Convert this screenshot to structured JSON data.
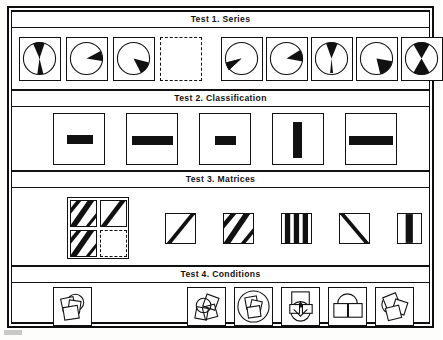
{
  "document": {
    "kind": "psychometric-test-figure",
    "background_color": "#ffffff",
    "ink_color": "#111111"
  },
  "sections": [
    {
      "id": "test-1",
      "title": "Test 1.  Series",
      "kind": "series",
      "stem_label": "series-stem",
      "stem_count": 3,
      "blank_label": "missing-item",
      "option_count": 5,
      "stem": [
        {
          "name": "pie-narrow-wedge-down",
          "start_deg": 172,
          "sweep_deg": 22,
          "second_start_deg": null,
          "second_sweep_deg": null
        },
        {
          "name": "pie-wedge-upper-right",
          "start_deg": 22,
          "sweep_deg": 52,
          "second_start_deg": null,
          "second_sweep_deg": null
        },
        {
          "name": "pie-wedge-lower-right",
          "start_deg": 92,
          "sweep_deg": 52,
          "second_start_deg": null,
          "second_sweep_deg": null
        }
      ],
      "options": [
        {
          "name": "pie-wedge-lower-left",
          "start_deg": 185,
          "sweep_deg": 52,
          "second_start_deg": null,
          "second_sweep_deg": null
        },
        {
          "name": "pie-wedge-right",
          "start_deg": 65,
          "sweep_deg": 48,
          "second_start_deg": null,
          "second_sweep_deg": null
        },
        {
          "name": "pie-wide-wedge-down",
          "start_deg": 162,
          "sweep_deg": 40,
          "second_start_deg": null,
          "second_sweep_deg": null
        },
        {
          "name": "pie-wedge-lower-right-wide",
          "start_deg": 100,
          "sweep_deg": 62,
          "second_start_deg": null,
          "second_sweep_deg": null
        },
        {
          "name": "pie-hourglass-two-wedges",
          "start_deg": 150,
          "sweep_deg": 60,
          "second_start_deg": 330,
          "second_sweep_deg": 60
        }
      ]
    },
    {
      "id": "test-2",
      "title": "Test 2.  Classification",
      "kind": "classification",
      "option_count": 5,
      "options": [
        {
          "name": "box-bar-horizontal-small",
          "box_w": 52,
          "box_h": 52,
          "bar_w": 26,
          "bar_h": 9,
          "orient": "horizontal"
        },
        {
          "name": "box-bar-horizontal-wide",
          "box_w": 52,
          "box_h": 52,
          "bar_w": 41,
          "bar_h": 9,
          "orient": "horizontal"
        },
        {
          "name": "box-bar-horizontal-tiny",
          "box_w": 52,
          "box_h": 52,
          "bar_w": 21,
          "bar_h": 9,
          "orient": "horizontal"
        },
        {
          "name": "box-bar-vertical-tall",
          "box_w": 52,
          "box_h": 52,
          "bar_w": 9,
          "bar_h": 36,
          "orient": "vertical"
        },
        {
          "name": "box-bar-horizontal-long",
          "box_w": 52,
          "box_h": 52,
          "bar_w": 44,
          "bar_h": 9,
          "orient": "horizontal"
        }
      ]
    },
    {
      "id": "test-3",
      "title": "Test 3.  Matrices",
      "kind": "matrices",
      "matrix_label": "matrix-2x2",
      "matrix_cells": [
        {
          "name": "matrix-cell-two-diagonals-up",
          "stripes": 2,
          "orient": "diagonal-up"
        },
        {
          "name": "matrix-cell-one-diagonal-up",
          "stripes": 1,
          "orient": "diagonal-up"
        },
        {
          "name": "matrix-cell-two-diagonals-up",
          "stripes": 2,
          "orient": "diagonal-up"
        },
        {
          "name": "matrix-cell-blank",
          "stripes": 0,
          "orient": "blank"
        }
      ],
      "option_count": 5,
      "options": [
        {
          "name": "option-one-diagonal-up",
          "stripes": 1,
          "orient": "diagonal-up"
        },
        {
          "name": "option-two-diagonals-up",
          "stripes": 2,
          "orient": "diagonal-up"
        },
        {
          "name": "option-three-vertical-bars",
          "stripes": 3,
          "orient": "vertical"
        },
        {
          "name": "option-one-diagonal-down",
          "stripes": 1,
          "orient": "diagonal-down"
        },
        {
          "name": "option-one-vertical-bar",
          "stripes": 1,
          "orient": "vertical"
        }
      ]
    },
    {
      "id": "test-4",
      "title": "Test 4.  Conditions",
      "kind": "conditions",
      "stem_label": "conditions-stem",
      "option_count": 5,
      "stem": {
        "name": "stem-overlapping-squares-circle"
      },
      "options": [
        {
          "name": "option-two-squares-circle-open"
        },
        {
          "name": "option-squares-inside-large-circle"
        },
        {
          "name": "option-square-circle-stacked"
        },
        {
          "name": "option-circle-between-two-squares"
        },
        {
          "name": "option-three-rotated-squares-circle"
        }
      ]
    }
  ]
}
